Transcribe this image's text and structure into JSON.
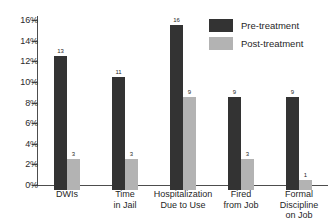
{
  "chart_data": {
    "type": "bar",
    "title": "",
    "xlabel": "",
    "ylabel": "",
    "ylim": [
      0,
      16
    ],
    "grid": false,
    "legend_position": "top-right",
    "y_tick_labels": [
      "16%",
      "14%",
      "12%",
      "10%",
      "8%",
      "6%",
      "4%",
      "2%",
      "0%"
    ],
    "y_tick_values": [
      16,
      14,
      12,
      10,
      8,
      6,
      4,
      2,
      0
    ],
    "categories": [
      "DWIs",
      "Time in Jail",
      "Hospitalization Due to Use",
      "Fired from Job",
      "Formal Discipline on Job"
    ],
    "category_label_lines": [
      [
        "DWIs"
      ],
      [
        "Time",
        "in Jail"
      ],
      [
        "Hospitalization",
        "Due to Use"
      ],
      [
        "Fired",
        "from Job"
      ],
      [
        "Formal",
        "Discipline",
        "on Job"
      ]
    ],
    "series": [
      {
        "name": "Pre-treatment",
        "color": "#333333",
        "values": [
          13,
          11,
          16,
          9,
          9
        ],
        "value_labels": [
          "13",
          "11",
          "16",
          "9",
          "9"
        ]
      },
      {
        "name": "Post-treatment",
        "color": "#b3b3b3",
        "values": [
          3,
          3,
          9,
          3,
          1
        ],
        "value_labels": [
          "3",
          "3",
          "9",
          "3",
          "1"
        ]
      }
    ]
  },
  "legend": {
    "items": [
      {
        "label": "Pre-treatment",
        "color": "#333333"
      },
      {
        "label": "Post-treatment",
        "color": "#b3b3b3"
      }
    ]
  },
  "axis": {
    "line_color": "#4d4d4d"
  }
}
